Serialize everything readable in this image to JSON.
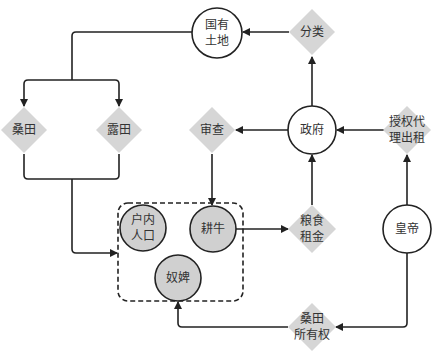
{
  "colors": {
    "line": "#222222",
    "diamond_fill": "#d6d6d6",
    "circle_fill_grey": "#d0d0d0",
    "circle_fill_white": "#ffffff",
    "text": "#333333"
  },
  "nodes": {
    "state_land": {
      "label": "国有\n土地",
      "shape": "circle"
    },
    "classify": {
      "label": "分类",
      "shape": "diamond"
    },
    "mulberry_field": {
      "label": "桑田",
      "shape": "diamond"
    },
    "open_field": {
      "label": "露田",
      "shape": "diamond"
    },
    "review": {
      "label": "审查",
      "shape": "diamond"
    },
    "government": {
      "label": "政府",
      "shape": "circle"
    },
    "authorize_lease": {
      "label": "授权代\n理出租",
      "shape": "diamond"
    },
    "household_population": {
      "label": "户内\n人口",
      "shape": "circle"
    },
    "ox": {
      "label": "耕牛",
      "shape": "circle"
    },
    "slaves": {
      "label": "奴婢",
      "shape": "circle"
    },
    "grain_rent": {
      "label": "粮食\n租金",
      "shape": "diamond"
    },
    "emperor": {
      "label": "皇帝",
      "shape": "circle"
    },
    "mulberry_ownership": {
      "label": "桑田\n所有权",
      "shape": "diamond"
    }
  }
}
